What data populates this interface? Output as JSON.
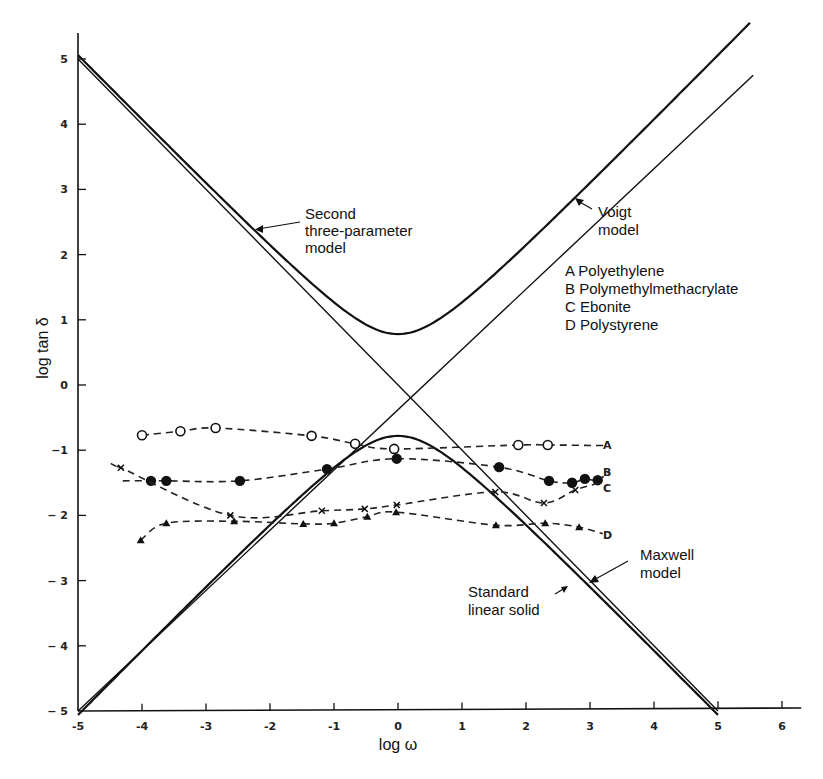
{
  "chart_data": {
    "type": "line",
    "title": "",
    "xlabel": "log ω",
    "ylabel": "log tan δ",
    "xlim": [
      -5,
      6.3
    ],
    "ylim": [
      -5,
      5.4
    ],
    "xticks": [
      -5,
      -4,
      -3,
      -2,
      -1,
      0,
      1,
      2,
      3,
      4,
      5,
      6
    ],
    "xtick_labels": [
      "-5",
      "-4",
      "-3",
      "-2",
      "-1",
      "0",
      "1",
      "2",
      "3",
      "4",
      "5",
      "6"
    ],
    "yticks": [
      -5,
      -4,
      -3,
      -2,
      -1,
      0,
      1,
      2,
      3,
      4,
      5
    ],
    "ytick_labels": [
      "− 5",
      "− 4",
      "− 3",
      "− 2",
      "−1",
      "0",
      "1",
      "2",
      "3",
      "4",
      "5"
    ],
    "grid": false,
    "models": [
      {
        "name": "Maxwell model",
        "kind": "line",
        "points": [
          [
            -5,
            5
          ],
          [
            5,
            -5
          ]
        ]
      },
      {
        "name": "Voigt model",
        "kind": "line",
        "points": [
          [
            -5,
            -5
          ],
          [
            5.55,
            4.75
          ]
        ]
      },
      {
        "name": "Second three-parameter model",
        "kind": "hyperbola_upper",
        "vertex": [
          0,
          0.78
        ],
        "x_range": [
          -5,
          5.5
        ]
      },
      {
        "name": "Standard linear solid",
        "kind": "hyperbola_lower",
        "vertex": [
          0,
          -0.78
        ],
        "x_range": [
          -5,
          5
        ]
      }
    ],
    "annotations": [
      {
        "text": [
          "Second",
          "three-parameter",
          "model"
        ],
        "target": "Second three-parameter model"
      },
      {
        "text": [
          "Voigt",
          "model"
        ],
        "target": "Voigt model"
      },
      {
        "text": [
          "Maxwell",
          "model"
        ],
        "target": "Maxwell model"
      },
      {
        "text": [
          "Standard",
          "linear solid"
        ],
        "target": "Standard linear solid"
      }
    ],
    "legend": [
      "A Polyethylene",
      "B Polymethylmethacrylate",
      "C Ebonite",
      "D Polystyrene"
    ],
    "series": [
      {
        "name": "A",
        "material": "Polyethylene",
        "marker": "open-circle",
        "x": [
          -4.0,
          -3.4,
          -2.85,
          -1.35,
          -0.67,
          -0.06,
          1.88,
          2.34
        ],
        "y": [
          -0.77,
          -0.71,
          -0.66,
          -0.78,
          -0.9,
          -0.98,
          -0.92,
          -0.92
        ],
        "curve_end": [
          3.25,
          -0.93
        ]
      },
      {
        "name": "B",
        "material": "Polymethylmethacrylate",
        "marker": "filled-circle",
        "x": [
          -3.86,
          -3.62,
          -2.47,
          -1.11,
          -0.02,
          1.58,
          2.36,
          2.72,
          2.92,
          3.12
        ],
        "y": [
          -1.47,
          -1.47,
          -1.47,
          -1.29,
          -1.13,
          -1.26,
          -1.47,
          -1.5,
          -1.44,
          -1.46
        ],
        "curve_start": [
          -4.3,
          -1.47
        ],
        "curve_end": [
          3.3,
          -1.33
        ]
      },
      {
        "name": "C",
        "material": "Ebonite",
        "marker": "cross",
        "x": [
          -4.33,
          -2.62,
          -1.19,
          -0.52,
          -0.02,
          1.52,
          2.28,
          2.77
        ],
        "y": [
          -1.27,
          -2.0,
          -1.93,
          -1.9,
          -1.84,
          -1.64,
          -1.81,
          -1.61
        ],
        "curve_start": [
          -4.4,
          -1.25
        ],
        "curve_end": [
          3.15,
          -1.5
        ]
      },
      {
        "name": "D",
        "material": "Polystyrene",
        "marker": "triangle",
        "x": [
          -4.02,
          -3.62,
          -2.56,
          -1.48,
          -1.0,
          -0.48,
          -0.03,
          1.53,
          2.3,
          2.83
        ],
        "y": [
          -2.38,
          -2.12,
          -2.09,
          -2.13,
          -2.12,
          -2.02,
          -1.95,
          -2.15,
          -2.12,
          -2.18
        ],
        "curve_end": [
          3.2,
          -2.28
        ]
      }
    ]
  },
  "labels": {
    "x_axis": "log ω",
    "y_axis": "log tan δ",
    "second_model": [
      "Second",
      "three-parameter",
      "model"
    ],
    "voigt": [
      "Voigt",
      "model"
    ],
    "maxwell": [
      "Maxwell",
      "model"
    ],
    "sls": [
      "Standard",
      "linear solid"
    ],
    "legend": [
      "A Polyethylene",
      "B Polymethylmethacrylate",
      "C Ebonite",
      "D Polystyrene"
    ],
    "series_letters": [
      "A",
      "B",
      "C",
      "D"
    ]
  }
}
